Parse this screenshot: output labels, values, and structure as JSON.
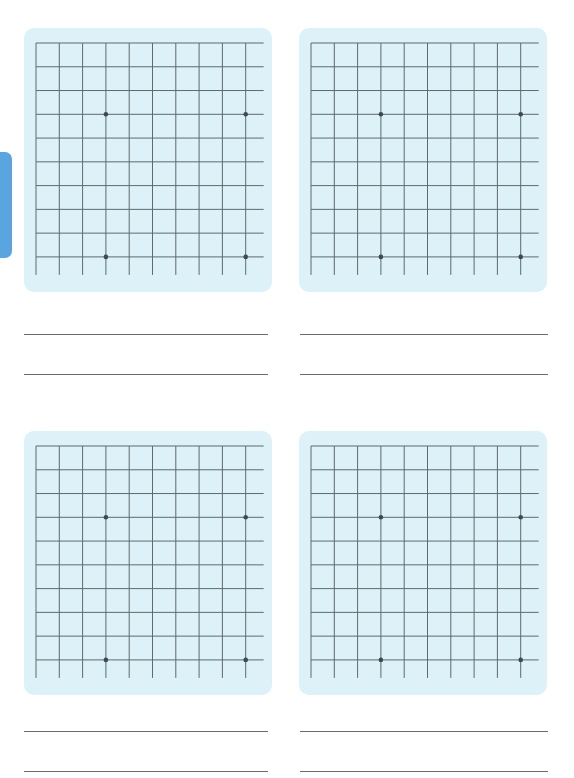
{
  "side_tab": {
    "label": "",
    "color": "#5aa5e0"
  },
  "grid": {
    "vertical_lines": 10,
    "horizontal_lines": 10,
    "cell_size_px": 23,
    "line_color": "#5e6a6e",
    "panel_color": "#dcf1f8",
    "dot_color": "#3d4a4e"
  },
  "exercises": [
    {
      "id": 1,
      "position": "top-left",
      "dots": [
        [
          3,
          3
        ],
        [
          9,
          3
        ],
        [
          3,
          9
        ],
        [
          9,
          9
        ]
      ],
      "answer_lines": 2
    },
    {
      "id": 2,
      "position": "top-right",
      "dots": [
        [
          3,
          3
        ],
        [
          9,
          3
        ],
        [
          3,
          9
        ],
        [
          9,
          9
        ]
      ],
      "answer_lines": 2
    },
    {
      "id": 3,
      "position": "bottom-left",
      "dots": [
        [
          3,
          3
        ],
        [
          9,
          3
        ],
        [
          3,
          9
        ],
        [
          9,
          9
        ]
      ],
      "answer_lines": 2
    },
    {
      "id": 4,
      "position": "bottom-right",
      "dots": [
        [
          3,
          3
        ],
        [
          9,
          3
        ],
        [
          3,
          9
        ],
        [
          9,
          9
        ]
      ],
      "answer_lines": 2
    }
  ]
}
